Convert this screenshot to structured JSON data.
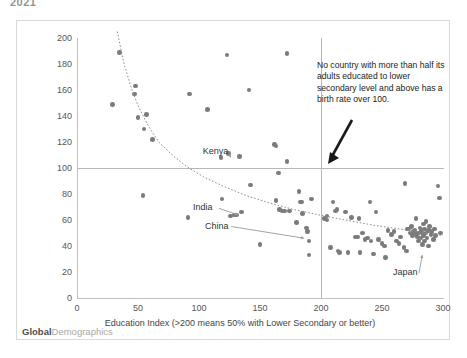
{
  "top_cut_text": "2021",
  "brand": {
    "bold": "Global",
    "light": "Demographics"
  },
  "annotation": {
    "text": "No country with  more than half its adults educated  to  lower secondary level and above has a birth rate over 100."
  },
  "labels": {
    "kenya": "Kenya",
    "india": "India",
    "china": "China",
    "japan": "Japan"
  },
  "chart_data": {
    "type": "scatter",
    "title": "",
    "xlabel": "Education Index (>200 means 50% with Lower Secondary or better)",
    "ylabel": "Birth Rate per thousand females aged 15 to 49 yrs",
    "xlim": [
      0,
      300
    ],
    "ylim": [
      0,
      200
    ],
    "xticks": [
      0,
      50,
      100,
      150,
      200,
      250,
      300
    ],
    "yticks": [
      0,
      20,
      40,
      60,
      80,
      100,
      120,
      140,
      160,
      180,
      200
    ],
    "grid": false,
    "legend": "none",
    "reference_lines": [
      {
        "axis": "y",
        "value": 100,
        "color": "#b7b7b7"
      },
      {
        "axis": "x",
        "value": 200,
        "color": "#b7b7b7"
      }
    ],
    "trendline": {
      "style": "dotted",
      "color": "#8a8a8a",
      "points": [
        [
          33,
          205
        ],
        [
          38,
          182
        ],
        [
          44,
          163
        ],
        [
          50,
          148
        ],
        [
          58,
          133
        ],
        [
          67,
          120
        ],
        [
          78,
          110
        ],
        [
          90,
          101
        ],
        [
          104,
          93
        ],
        [
          120,
          86
        ],
        [
          138,
          79
        ],
        [
          158,
          73
        ],
        [
          178,
          68
        ],
        [
          198,
          64
        ],
        [
          220,
          60
        ],
        [
          243,
          56
        ],
        [
          265,
          53
        ],
        [
          285,
          50
        ],
        [
          300,
          48
        ]
      ]
    },
    "annotations": [
      {
        "text": "Kenya",
        "x": 112,
        "y": 112,
        "points_to": [
          126,
          108
        ]
      },
      {
        "text": "India",
        "x": 104,
        "y": 69,
        "points_to": [
          132,
          64
        ]
      },
      {
        "text": "China",
        "x": 114,
        "y": 55,
        "points_to": [
          186,
          46
        ]
      },
      {
        "text": "Japan",
        "x": 268,
        "y": 19,
        "points_to": [
          283,
          33
        ]
      },
      {
        "text": "No country with  more than half its adults educated  to  lower secondary level and above has a birth rate over 100.",
        "x": 228,
        "y": 160,
        "points_to": [
          246,
          88
        ]
      }
    ],
    "points": [
      [
        35,
        189
      ],
      [
        29,
        149
      ],
      [
        48,
        163
      ],
      [
        47,
        157
      ],
      [
        50,
        139
      ],
      [
        55,
        130
      ],
      [
        57,
        141
      ],
      [
        62,
        122
      ],
      [
        54,
        79
      ],
      [
        91,
        62
      ],
      [
        92,
        157
      ],
      [
        107,
        145
      ],
      [
        118,
        108
      ],
      [
        119,
        76
      ],
      [
        123,
        187
      ],
      [
        124,
        111
      ],
      [
        126,
        63
      ],
      [
        129,
        64
      ],
      [
        131,
        64
      ],
      [
        133,
        109
      ],
      [
        135,
        66
      ],
      [
        141,
        160
      ],
      [
        142,
        87
      ],
      [
        150,
        41
      ],
      [
        162,
        118
      ],
      [
        163,
        117
      ],
      [
        163,
        75
      ],
      [
        165,
        96
      ],
      [
        166,
        68
      ],
      [
        168,
        67
      ],
      [
        170,
        67
      ],
      [
        172,
        188
      ],
      [
        172,
        105
      ],
      [
        174,
        67
      ],
      [
        180,
        58
      ],
      [
        182,
        82
      ],
      [
        183,
        74
      ],
      [
        184,
        74
      ],
      [
        185,
        65
      ],
      [
        188,
        54
      ],
      [
        189,
        51
      ],
      [
        190,
        44
      ],
      [
        190,
        33
      ],
      [
        192,
        76
      ],
      [
        203,
        61
      ],
      [
        205,
        63
      ],
      [
        205,
        60
      ],
      [
        208,
        39
      ],
      [
        210,
        74
      ],
      [
        212,
        67
      ],
      [
        213,
        68
      ],
      [
        214,
        36
      ],
      [
        215,
        35
      ],
      [
        220,
        66
      ],
      [
        222,
        35
      ],
      [
        225,
        62
      ],
      [
        228,
        47
      ],
      [
        230,
        47
      ],
      [
        231,
        61
      ],
      [
        232,
        35
      ],
      [
        234,
        50
      ],
      [
        236,
        45
      ],
      [
        238,
        46
      ],
      [
        240,
        74
      ],
      [
        241,
        44
      ],
      [
        243,
        34
      ],
      [
        245,
        66
      ],
      [
        247,
        45
      ],
      [
        250,
        42
      ],
      [
        252,
        40
      ],
      [
        253,
        31
      ],
      [
        255,
        52
      ],
      [
        258,
        49
      ],
      [
        260,
        51
      ],
      [
        262,
        44
      ],
      [
        264,
        42
      ],
      [
        265,
        47
      ],
      [
        268,
        39
      ],
      [
        269,
        88
      ],
      [
        270,
        36
      ],
      [
        271,
        53
      ],
      [
        272,
        53
      ],
      [
        273,
        50
      ],
      [
        274,
        55
      ],
      [
        275,
        48
      ],
      [
        276,
        51
      ],
      [
        277,
        52
      ],
      [
        278,
        61
      ],
      [
        278,
        49
      ],
      [
        279,
        47
      ],
      [
        280,
        50
      ],
      [
        280,
        44
      ],
      [
        281,
        54
      ],
      [
        282,
        52
      ],
      [
        282,
        46
      ],
      [
        283,
        50
      ],
      [
        283,
        41
      ],
      [
        284,
        57
      ],
      [
        284,
        48
      ],
      [
        285,
        53
      ],
      [
        285,
        44
      ],
      [
        286,
        59
      ],
      [
        286,
        50
      ],
      [
        287,
        46
      ],
      [
        288,
        52
      ],
      [
        288,
        40
      ],
      [
        289,
        55
      ],
      [
        290,
        49
      ],
      [
        291,
        51
      ],
      [
        292,
        45
      ],
      [
        293,
        53
      ],
      [
        294,
        48
      ],
      [
        296,
        86
      ],
      [
        297,
        77
      ],
      [
        298,
        50
      ]
    ]
  }
}
